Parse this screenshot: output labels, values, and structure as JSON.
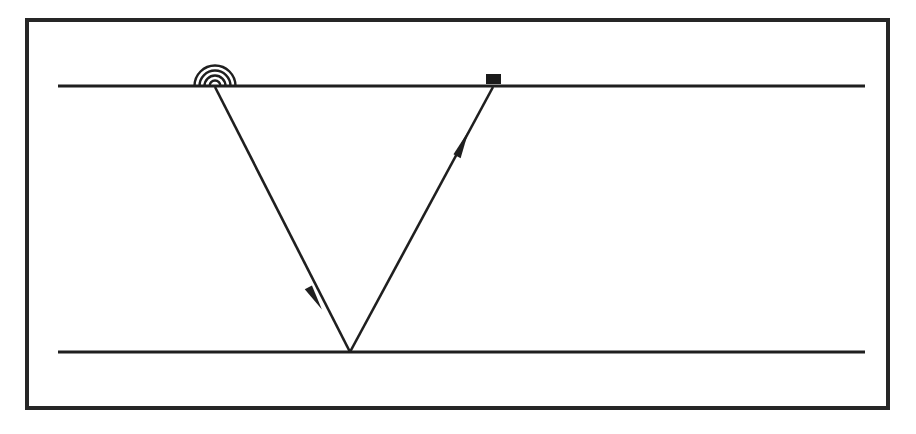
{
  "figure": {
    "title": "Single-bounce ray reflection diagram",
    "background_color": "#ffffff",
    "ink_color": "#1a1a1a",
    "canvas": {
      "width": 916,
      "height": 434
    }
  },
  "frame": {
    "name": "figure-border",
    "x": 25,
    "y": 18,
    "width": 865,
    "height": 392,
    "stroke_width": 4,
    "color": "#262626"
  },
  "interfaces": [
    {
      "label": "surface-line",
      "role": "upper interface / ground surface",
      "x1": 58,
      "x2": 865,
      "y": 86,
      "stroke_width": 3.2,
      "color": "#1f1f1f"
    },
    {
      "label": "reflector-line",
      "role": "lower interface / reflecting layer",
      "x1": 58,
      "x2": 865,
      "y": 352,
      "stroke_width": 3.2,
      "color": "#1f1f1f"
    }
  ],
  "source": {
    "label": "source-antenna",
    "role": "transmitter emitting radiating waves",
    "x": 215,
    "y": 86,
    "arc_count": 4,
    "arc_radii": [
      5.5,
      10.5,
      15.5,
      20.5
    ],
    "arc_stroke_width": 2.4,
    "color": "#1f1f1f"
  },
  "receiver": {
    "label": "receiver-box",
    "role": "detector sitting on the surface",
    "x": 486,
    "y": 74,
    "width": 15,
    "height": 10,
    "color": "#1a1a1a"
  },
  "reflection_point": {
    "label": "reflection-point",
    "x": 350,
    "y": 352
  },
  "rays": [
    {
      "label": "downgoing-ray",
      "role": "incident ray from source to reflector",
      "x1": 215,
      "y1": 87,
      "x2": 350,
      "y2": 352,
      "stroke_width": 2.6,
      "color": "#1f1f1f",
      "arrow": {
        "label": "downgoing-arrowhead",
        "x": 316,
        "y": 298,
        "angle_deg": 63,
        "length": 26,
        "half_width": 6
      }
    },
    {
      "label": "upgoing-ray",
      "role": "reflected ray from reflector to receiver",
      "x1": 350,
      "y1": 352,
      "x2": 493,
      "y2": 87,
      "stroke_width": 2.6,
      "color": "#1f1f1f",
      "arrow": {
        "label": "upgoing-arrowhead",
        "x": 462,
        "y": 143,
        "angle_deg": -61.6,
        "length": 28,
        "half_width": 6
      }
    }
  ]
}
